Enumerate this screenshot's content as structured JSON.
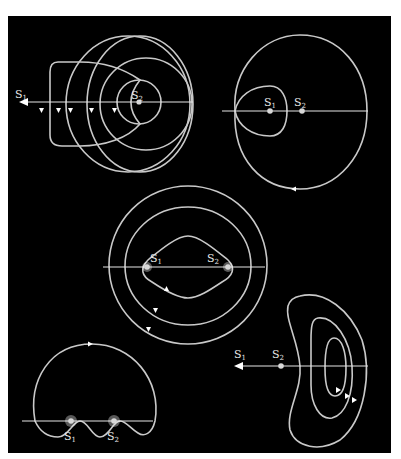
{
  "figure": {
    "background_color": "#000000",
    "curve_color": "#c9c9c9"
  },
  "labels": {
    "s_letter": "S",
    "sub1": "1",
    "sub2": "2"
  },
  "panels": [
    {
      "id": "top-left",
      "sources": [
        "S1",
        "S2"
      ],
      "axis_arrow": "left",
      "direction_markers": 5
    },
    {
      "id": "top-right",
      "sources": [
        "S1",
        "S2"
      ],
      "axis_arrow": "none",
      "direction_markers": 1
    },
    {
      "id": "center",
      "sources": [
        "S1",
        "S2"
      ],
      "axis_arrow": "none",
      "direction_markers": 3
    },
    {
      "id": "bottom-left",
      "sources": [
        "S1",
        "S2"
      ],
      "axis_arrow": "none",
      "direction_markers": 1
    },
    {
      "id": "bottom-right",
      "sources": [
        "S1",
        "S2"
      ],
      "axis_arrow": "left",
      "direction_markers": 3
    }
  ]
}
